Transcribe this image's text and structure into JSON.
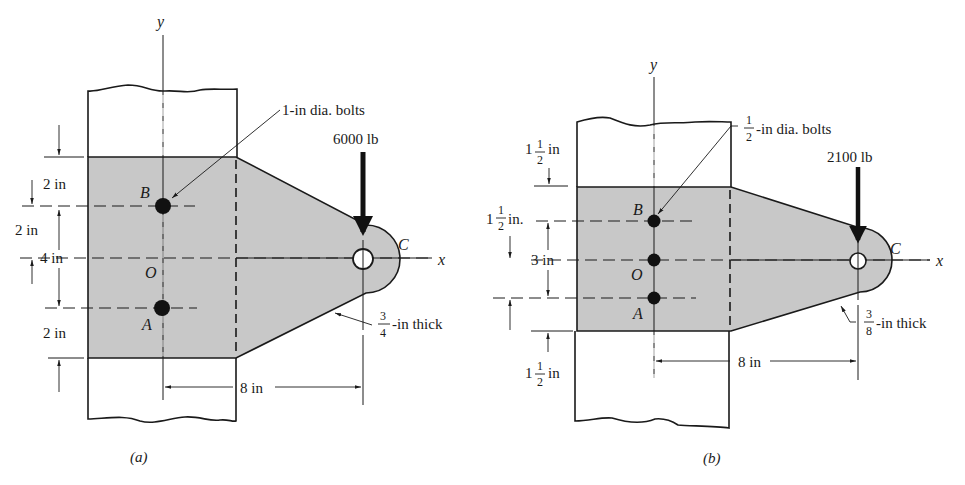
{
  "figure": {
    "colors": {
      "plate_fill": "#c8c8c8",
      "line": "#1a1a1a",
      "bolt": "#111111",
      "background": "#ffffff"
    },
    "a": {
      "caption": "(a)",
      "axis_x": "x",
      "axis_y": "y",
      "point_B": "B",
      "point_O": "O",
      "point_A": "A",
      "point_C": "C",
      "bolt_label": "1-in dia. bolts",
      "load_label": "6000 lb",
      "thickness_num": "3",
      "thickness_den": "4",
      "thickness_text": "-in thick",
      "dim_top": "2 in",
      "dim_upper": "2 in",
      "dim_total": "4 in",
      "dim_bottom": "2 in",
      "dim_horizontal": "8 in"
    },
    "b": {
      "caption": "(b)",
      "axis_x": "x",
      "axis_y": "y",
      "point_B": "B",
      "point_O": "O",
      "point_A": "A",
      "point_C": "C",
      "bolt_num": "1",
      "bolt_den": "2",
      "bolt_text": "-in dia. bolts",
      "load_label": "2100 lb",
      "thickness_num": "3",
      "thickness_den": "8",
      "thickness_text": "-in thick",
      "dim_top_whole": "1",
      "dim_top_num": "1",
      "dim_top_den": "2",
      "dim_top_unit": "in",
      "dim_upper_whole": "1",
      "dim_upper_num": "1",
      "dim_upper_den": "2",
      "dim_upper_unit": "in.",
      "dim_total": "3 in",
      "dim_bottom_whole": "1",
      "dim_bottom_num": "1",
      "dim_bottom_den": "2",
      "dim_bottom_unit": "in",
      "dim_horizontal": "8 in"
    }
  }
}
